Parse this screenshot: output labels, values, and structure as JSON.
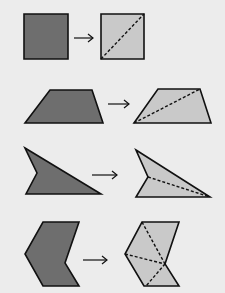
{
  "diagram": {
    "colors": {
      "background": "#ececec",
      "original_fill": "#6e6e6e",
      "divided_fill": "#c9c9c9",
      "stroke": "#111111"
    },
    "rows": [
      {
        "name": "square",
        "original": "24,14 68,14 68,59 24,59",
        "divided": "101,14 144,14 144,59 101,59",
        "dashes": [
          [
            101,
            59,
            144,
            14
          ]
        ],
        "arrow": [
          74,
          38,
          93,
          38
        ]
      },
      {
        "name": "trapezoid",
        "original": "50,90 92,90 103,123 25,123",
        "divided": "158,89 200,89 211,123 134,123",
        "dashes": [
          [
            134,
            123,
            200,
            89
          ]
        ],
        "arrow": [
          108,
          104,
          129,
          104
        ]
      },
      {
        "name": "concave-arrowhead",
        "original": "25,148 101,194 26,194 37,173",
        "divided": "136,150 210,197 136,197 148,177",
        "dashes": [
          [
            148,
            177,
            210,
            197
          ]
        ],
        "arrow": [
          92,
          175,
          117,
          175
        ]
      },
      {
        "name": "chevron",
        "original": "43,222 79,222 65,263 79,286 43,286 25,254",
        "divided": "142,222 179,222 165,264 179,286 144,286 125,254",
        "dashes": [
          [
            142,
            222,
            165,
            264
          ],
          [
            125,
            254,
            165,
            264
          ],
          [
            165,
            264,
            146,
            286
          ]
        ],
        "arrow": [
          83,
          260,
          107,
          260
        ]
      }
    ]
  }
}
